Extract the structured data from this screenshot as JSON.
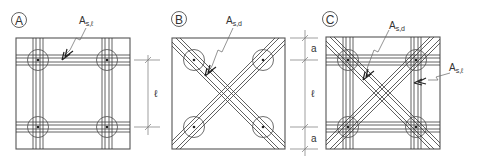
{
  "figure": {
    "panels": [
      {
        "id": "A",
        "label": "A",
        "rebar_label": "A",
        "rebar_sub": "s,ℓ",
        "description": "orthogonal reinforcement bands over columns"
      },
      {
        "id": "B",
        "label": "B",
        "rebar_label": "A",
        "rebar_sub": "s,d",
        "description": "diagonal reinforcement bands"
      },
      {
        "id": "C",
        "label": "C",
        "rebar_label_d": "A",
        "rebar_sub_d": "s,d",
        "rebar_label_l": "A",
        "rebar_sub_l": "s,ℓ",
        "description": "orthogonal and diagonal reinforcement combined"
      }
    ],
    "dimensions": {
      "span": "ℓ",
      "edge": "a"
    },
    "colors": {
      "line": "#3a3a3a",
      "frame": "#555555",
      "background": "#ffffff"
    }
  }
}
